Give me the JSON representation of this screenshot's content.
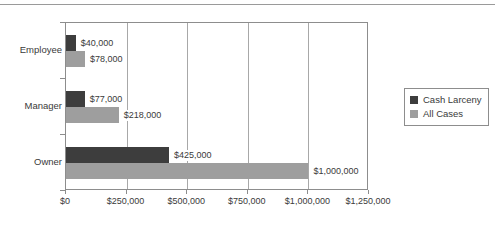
{
  "chart_data": {
    "type": "bar",
    "orientation": "horizontal",
    "title": "",
    "subtitle": "",
    "xlabel": "",
    "ylabel": "",
    "categories": [
      "Employee",
      "Manager",
      "Owner"
    ],
    "series": [
      {
        "name": "Cash Larceny",
        "color": "#3d3d3d",
        "values": [
          40000,
          77000,
          425000
        ],
        "labels": [
          "$40,000",
          "$77,000",
          "$425,000"
        ]
      },
      {
        "name": "All Cases",
        "color": "#9e9e9e",
        "values": [
          78000,
          218000,
          1000000
        ],
        "labels": [
          "$78,000",
          "$218,000",
          "$1,000,000"
        ]
      }
    ],
    "xlim": [
      0,
      1250000
    ],
    "xticks": [
      0,
      250000,
      500000,
      750000,
      1000000,
      1250000
    ],
    "xticklabels": [
      "$0",
      "$250,000",
      "$500,000",
      "$750,000",
      "$1,000,000",
      "$1,250,000"
    ],
    "grid": true,
    "grid_axis": "x",
    "legend_position": "right",
    "legend_entries": [
      "Cash Larceny",
      "All Cases"
    ]
  },
  "legend": {
    "items": [
      {
        "label": "Cash Larceny",
        "color": "#3d3d3d"
      },
      {
        "label": "All Cases",
        "color": "#9e9e9e"
      }
    ]
  },
  "colors": {
    "cash_larceny": "#3d3d3d",
    "all_cases": "#9e9e9e",
    "axis": "#8d8d8d",
    "gridline": "#a8a8a8",
    "text": "#3a3a3a",
    "background": "#ffffff"
  }
}
